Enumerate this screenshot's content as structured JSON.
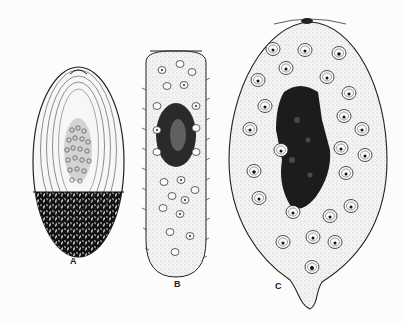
{
  "figure": {
    "panels": [
      {
        "id": "A",
        "label": "A",
        "label_pos": {
          "x": 70,
          "y": 256
        }
      },
      {
        "id": "B",
        "label": "B",
        "label_pos": {
          "x": 174,
          "y": 279
        }
      },
      {
        "id": "C",
        "label": "C",
        "label_pos": {
          "x": 275,
          "y": 281
        }
      }
    ],
    "colors": {
      "ink": "#1a1a1a",
      "paper": "#fcfcfc",
      "stipple": "#e4e4e4"
    }
  }
}
